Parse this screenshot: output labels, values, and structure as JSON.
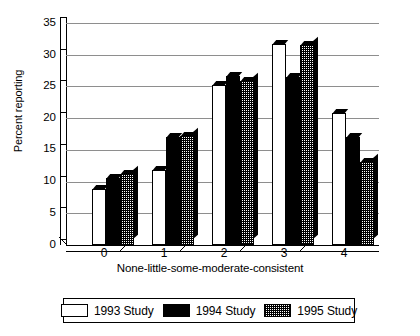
{
  "chart_data": {
    "type": "bar",
    "title": "",
    "xlabel": "None-little-some-moderate-consistent",
    "ylabel": "Percent reporting",
    "categories": [
      "0",
      "1",
      "2",
      "3",
      "4"
    ],
    "ylim": [
      0,
      35
    ],
    "yticks": [
      0,
      5,
      10,
      15,
      20,
      25,
      30,
      35
    ],
    "grid": true,
    "legend_position": "bottom",
    "series": [
      {
        "name": "1993 Study",
        "fill": "white",
        "values": [
          8.8,
          11.8,
          25.2,
          31.7,
          20.8
        ]
      },
      {
        "name": "1994 Study",
        "fill": "black",
        "values": [
          10.5,
          17.0,
          26.7,
          26.5,
          17.0
        ]
      },
      {
        "name": "1995 Study",
        "fill": "hatch",
        "values": [
          11.2,
          17.2,
          25.8,
          31.5,
          13.1
        ]
      }
    ]
  },
  "axes": {
    "ylabel": "Percent reporting",
    "xlabel": "None-little-some-moderate-consistent",
    "ytick_labels": [
      "0",
      "5",
      "10",
      "15",
      "20",
      "25",
      "30",
      "35"
    ],
    "xtick_labels": [
      "0",
      "1",
      "2",
      "3",
      "4"
    ]
  },
  "legend": {
    "items": [
      {
        "label": "1993 Study",
        "swatch": "white-swatch"
      },
      {
        "label": "1994 Study",
        "swatch": "black-swatch"
      },
      {
        "label": "1995 Study",
        "swatch": "hatched-swatch"
      }
    ]
  },
  "colors": {
    "series_1993": "#ffffff",
    "series_1994": "#000000",
    "series_1995": "#808080",
    "gridline": "#8e8e8e",
    "axis": "#000000",
    "background": "#ffffff"
  }
}
